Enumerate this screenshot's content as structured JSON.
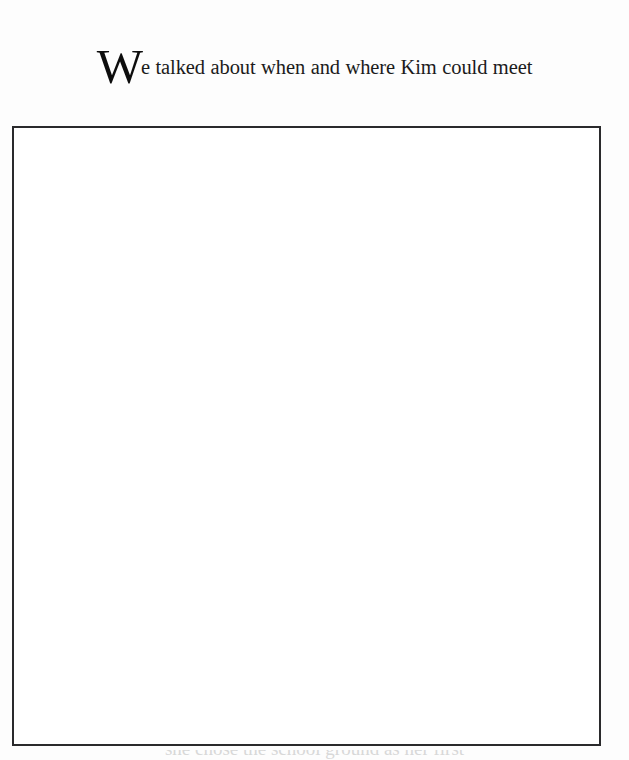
{
  "page": {
    "background_color": "#fdfdfd",
    "width": 629,
    "height": 760
  },
  "caption": {
    "dropcap": "W",
    "line1_rest": "e talked about when and where Kim could meet",
    "line2": "friends. I suggested she hang out wherever  kids get",
    "line3": "together, like on the school ground before and",
    "line4": "after school or in her neighborhood on weekends.",
    "full_text": "We talked about when and where Kim could meet friends. I suggested she hang out wherever  kids get together, like on the school ground before and after school or in her neighborhood on weekends.",
    "text_color": "#1b1b1b"
  },
  "image_frame": {
    "border_color": "#2a2a2c",
    "fill_color": "#ffffff",
    "caption": ""
  },
  "bottom_cutoff": {
    "text": "she chose the school ground as her first"
  }
}
